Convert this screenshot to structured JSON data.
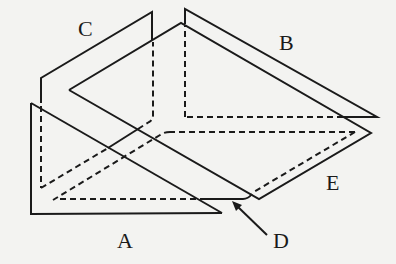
{
  "diagram": {
    "labels": {
      "A": "A",
      "B": "B",
      "C": "C",
      "D": "D",
      "E": "E"
    },
    "colors": {
      "stroke": "#1a1a1a",
      "background": "#f3f3f1"
    }
  }
}
